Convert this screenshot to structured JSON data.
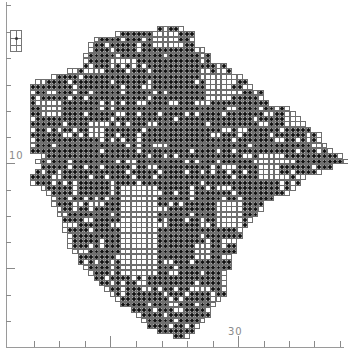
{
  "map": {
    "title": "",
    "type": "grid-distribution-map",
    "cell_size_px": 5.3,
    "origin_x": 30,
    "origin_y": 26,
    "colors": {
      "presence_dot": "#111111",
      "grid_line": "#6f6f6f",
      "axis": "#9a9a9a",
      "background": "#ffffff"
    },
    "rows_px_extent": [
      [
        160,
        180
      ],
      [
        118,
        190
      ],
      [
        95,
        190
      ],
      [
        93,
        190
      ],
      [
        90,
        200
      ],
      [
        88,
        205
      ],
      [
        85,
        210
      ],
      [
        85,
        225
      ],
      [
        70,
        230
      ],
      [
        55,
        240
      ],
      [
        37,
        245
      ],
      [
        35,
        250
      ],
      [
        35,
        258
      ],
      [
        35,
        262
      ],
      [
        35,
        265
      ],
      [
        30,
        285
      ],
      [
        30,
        290
      ],
      [
        30,
        300
      ],
      [
        30,
        305
      ],
      [
        35,
        310
      ],
      [
        35,
        318
      ],
      [
        35,
        320
      ],
      [
        35,
        322
      ],
      [
        35,
        330
      ],
      [
        45,
        340
      ],
      [
        40,
        345
      ],
      [
        42,
        330
      ],
      [
        40,
        320
      ],
      [
        32,
        305
      ],
      [
        35,
        300
      ],
      [
        45,
        295
      ],
      [
        50,
        285
      ],
      [
        55,
        270
      ],
      [
        55,
        262
      ],
      [
        58,
        258
      ],
      [
        60,
        255
      ],
      [
        62,
        250
      ],
      [
        65,
        245
      ],
      [
        65,
        240
      ],
      [
        68,
        238
      ],
      [
        70,
        235
      ],
      [
        72,
        232
      ],
      [
        75,
        232
      ],
      [
        78,
        230
      ],
      [
        80,
        228
      ],
      [
        85,
        228
      ],
      [
        90,
        226
      ],
      [
        95,
        225
      ],
      [
        100,
        225
      ],
      [
        105,
        224
      ],
      [
        110,
        222
      ],
      [
        115,
        220
      ],
      [
        125,
        215
      ],
      [
        135,
        210
      ],
      [
        140,
        205
      ],
      [
        145,
        200
      ],
      [
        150,
        195
      ],
      [
        160,
        190
      ],
      [
        175,
        185
      ]
    ],
    "voids_px": [
      [
        120,
        185,
        155,
        270
      ],
      [
        150,
        30,
        175,
        45
      ],
      [
        200,
        70,
        230,
        95
      ],
      [
        255,
        150,
        275,
        175
      ],
      [
        215,
        200,
        240,
        225
      ],
      [
        40,
        100,
        60,
        115
      ],
      [
        85,
        120,
        100,
        135
      ],
      [
        280,
        110,
        300,
        125
      ],
      [
        190,
        240,
        205,
        255
      ]
    ],
    "fill_density": 0.82,
    "inset": {
      "label": "key-box"
    }
  },
  "axes": {
    "y_ticks_px": [
      5,
      32,
      58,
      85,
      111,
      137,
      163,
      190,
      216,
      242,
      268,
      295,
      321
    ],
    "y_long_ticks_px": [
      163,
      268
    ],
    "y_label": {
      "text": "10",
      "x": 9,
      "y": 150
    },
    "x_ticks_px": [
      34,
      59,
      85,
      110,
      136,
      162,
      187,
      213,
      238,
      264,
      289,
      314,
      340
    ],
    "x_long_ticks_px": [
      110,
      238
    ],
    "x_label": {
      "text": "30",
      "x": 228,
      "y": 326
    }
  }
}
